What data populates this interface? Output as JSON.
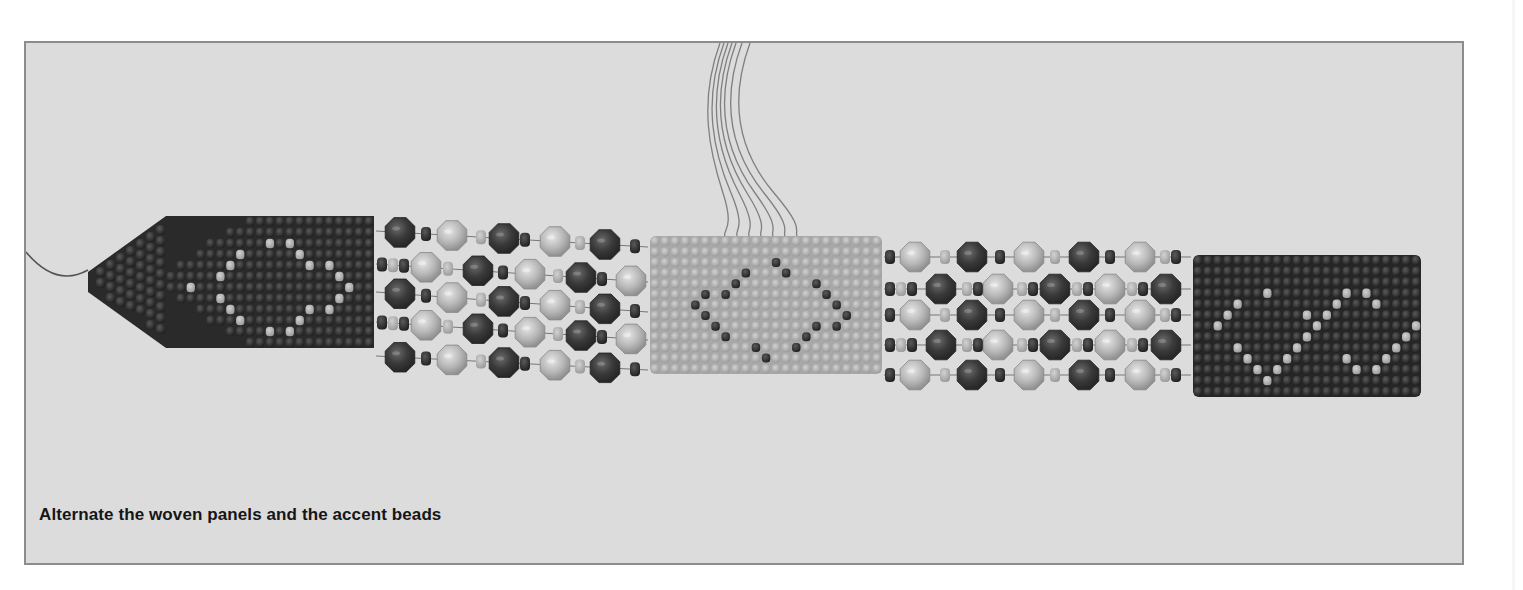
{
  "figure": {
    "caption": "Alternate the woven panels and the accent beads",
    "colors": {
      "background": "#dcdcdc",
      "border": "#8c8c8c",
      "dark_seed": "#2e2e2e",
      "dark_seed_hi": "#575757",
      "light_seed": "#a9a9a9",
      "light_panel": "#b4b4b4",
      "dark_facet": "#3c3c3c",
      "light_facet": "#b9b9b9",
      "spacer_dark": "#3a3a3a",
      "spacer_light": "#b0b0b0",
      "thread": "#6e6e6e"
    },
    "panels": [
      {
        "name": "left-woven-panel",
        "tone": "dark",
        "x": 140,
        "y": 173,
        "w": 208,
        "h": 132,
        "tapered": true,
        "accent": "diamond"
      },
      {
        "name": "center-woven-panel",
        "tone": "light",
        "x": 624,
        "y": 193,
        "w": 232,
        "h": 138,
        "tapered": false,
        "accent": "diamond"
      },
      {
        "name": "right-woven-panel",
        "tone": "dark",
        "x": 1167,
        "y": 212,
        "w": 228,
        "h": 142,
        "tapered": false,
        "accent": "double-diamond"
      }
    ],
    "strands": [
      {
        "name": "left-accent-strand",
        "x_start": 350,
        "x_end": 622,
        "rows_start": [
          188,
          221,
          249,
          279,
          313
        ],
        "rows_end": [
          204,
          239,
          269,
          297,
          327
        ],
        "large_x": [
          384,
          436,
          488,
          539,
          589
        ],
        "phase": 0
      },
      {
        "name": "right-accent-strand",
        "x_start": 858,
        "x_end": 1165,
        "rows_start": [
          214,
          246,
          272,
          302,
          332
        ],
        "rows_end": [
          214,
          246,
          272,
          302,
          332
        ],
        "large_x": [
          899,
          956,
          1013,
          1068,
          1124
        ],
        "phase": 1
      }
    ],
    "threads": {
      "hanging_count": 7,
      "top_x": [
        694,
        698,
        702,
        706,
        710,
        716,
        724
      ],
      "bottom_x": [
        700,
        712,
        724,
        736,
        748,
        760,
        772
      ],
      "bottom_y": 196,
      "tail": {
        "from": [
          0,
          209
        ],
        "ctrl": [
          30,
          245
        ],
        "to": [
          62,
          227
        ]
      }
    }
  }
}
